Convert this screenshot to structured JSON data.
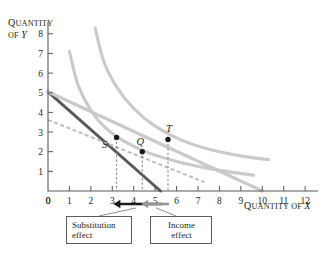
{
  "chart_data": {
    "type": "line",
    "title": "",
    "xlabel": "QUANTITY OF X",
    "ylabel": "QUANTITY OF Y",
    "xlim": [
      0,
      12.6
    ],
    "ylim": [
      0,
      8.6
    ],
    "xticks": [
      "0",
      "1",
      "2",
      "3",
      "4",
      "5",
      "6",
      "7",
      "8",
      "9",
      "10",
      "11",
      "12"
    ],
    "yticks": [
      "1",
      "2",
      "3",
      "4",
      "5",
      "6",
      "7",
      "8"
    ],
    "grid": false,
    "legend": "none",
    "series": [
      {
        "name": "original-budget-line",
        "style": "solid-dark",
        "color": "#58595b",
        "points": [
          [
            0,
            5.05
          ],
          [
            5.25,
            0
          ]
        ]
      },
      {
        "name": "new-budget-line",
        "style": "solid-gray",
        "color": "#c9cacc",
        "points": [
          [
            0,
            5.05
          ],
          [
            10.0,
            0
          ]
        ]
      },
      {
        "name": "compensated-budget-line",
        "style": "dashed-gray",
        "color": "#bcbec0",
        "points": [
          [
            0,
            3.62
          ],
          [
            7.3,
            0.45
          ]
        ]
      },
      {
        "name": "indifference-curve-1",
        "style": "solid-gray",
        "color": "#c9cacc",
        "points": [
          [
            1.0,
            7.1
          ],
          [
            1.4,
            5.4
          ],
          [
            2.0,
            4.1
          ],
          [
            2.7,
            3.2
          ],
          [
            3.6,
            2.5
          ],
          [
            4.8,
            1.9
          ],
          [
            6.2,
            1.45
          ],
          [
            8.0,
            1.05
          ],
          [
            9.6,
            0.8
          ]
        ]
      },
      {
        "name": "indifference-curve-2",
        "style": "solid-gray",
        "color": "#c9cacc",
        "points": [
          [
            2.2,
            8.3
          ],
          [
            2.6,
            6.6
          ],
          [
            3.2,
            5.3
          ],
          [
            4.0,
            4.2
          ],
          [
            5.0,
            3.3
          ],
          [
            6.2,
            2.6
          ],
          [
            7.6,
            2.1
          ],
          [
            9.2,
            1.75
          ],
          [
            10.3,
            1.6
          ]
        ]
      }
    ],
    "points": [
      {
        "label": "S",
        "x": 3.2,
        "y": 2.72,
        "label_dx": -12,
        "label_dy": 10
      },
      {
        "label": "Q",
        "x": 4.4,
        "y": 2.0,
        "label_dx": -2,
        "label_dy": -7
      },
      {
        "label": "T",
        "x": 5.6,
        "y": 2.62,
        "label_dx": 1,
        "label_dy": -8
      }
    ],
    "droplines": [
      {
        "from_point": "S",
        "x": 3.2,
        "y_top": 2.72
      },
      {
        "from_point": "Q",
        "x": 4.4,
        "y_top": 2.0
      },
      {
        "from_point": "T",
        "x": 5.6,
        "y_top": 2.62
      }
    ],
    "effect_arrows": [
      {
        "name": "substitution-effect-arrow",
        "from_x": 5.3,
        "to_x": 3.05,
        "color": "#1a1a1a"
      },
      {
        "name": "income-effect-arrow",
        "from_x": 5.65,
        "to_x": 4.35,
        "color": "#939598"
      }
    ],
    "annotations": [
      {
        "name": "substitution-effect",
        "line1": "Substitution",
        "line2": "effect"
      },
      {
        "name": "income-effect",
        "line1": "Income",
        "line2": "effect"
      }
    ]
  },
  "labels": {
    "y_axis_title_cap": "Q",
    "y_axis_title_rest": "UANTITY",
    "y_axis_of": "OF ",
    "y_axis_var": "Y",
    "x_axis_title_cap": "Q",
    "x_axis_title_rest": "UANTITY OF ",
    "x_axis_var": "X",
    "origin": "0"
  }
}
